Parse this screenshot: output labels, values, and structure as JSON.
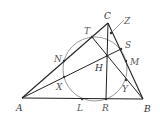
{
  "diagram": {
    "colors": {
      "line": "#222222",
      "circle": "#999999",
      "label": "#555555",
      "point": "#333333"
    },
    "vertices": {
      "A": {
        "label": "A",
        "x": 22,
        "y": 98
      },
      "B": {
        "label": "B",
        "x": 143,
        "y": 99
      },
      "C": {
        "label": "C",
        "x": 108,
        "y": 23
      }
    },
    "points": {
      "T": {
        "label": "T",
        "x": 92,
        "y": 37
      },
      "Z": {
        "label": "Z",
        "x": 111,
        "y": 33
      },
      "S": {
        "label": "S",
        "x": 121,
        "y": 49
      },
      "M": {
        "label": "M",
        "x": 126,
        "y": 61
      },
      "N": {
        "label": "N",
        "x": 64,
        "y": 61
      },
      "H": {
        "label": "H",
        "x": 107,
        "y": 56
      },
      "X": {
        "label": "X",
        "x": 64,
        "y": 77
      },
      "Y": {
        "label": "Y",
        "x": 126,
        "y": 80
      },
      "L": {
        "label": "L",
        "x": 82,
        "y": 99
      },
      "R": {
        "label": "R",
        "x": 106,
        "y": 99
      }
    },
    "circle": {
      "cx": 95,
      "cy": 69,
      "r": 32
    },
    "segments": [
      [
        "A",
        "B"
      ],
      [
        "A",
        "C"
      ],
      [
        "B",
        "C"
      ],
      [
        "A",
        "S"
      ],
      [
        "B",
        "T"
      ],
      [
        "C",
        "R"
      ]
    ]
  }
}
